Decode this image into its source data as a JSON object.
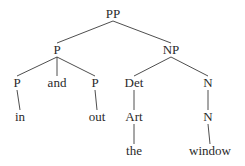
{
  "diagram": {
    "type": "syntax-tree",
    "nodes": [
      {
        "id": "pp",
        "label": "PP"
      },
      {
        "id": "p_top",
        "label": "P"
      },
      {
        "id": "np",
        "label": "NP"
      },
      {
        "id": "p_left",
        "label": "P"
      },
      {
        "id": "and",
        "label": "and"
      },
      {
        "id": "p_right",
        "label": "P"
      },
      {
        "id": "det",
        "label": "Det"
      },
      {
        "id": "n_top",
        "label": "N"
      },
      {
        "id": "in",
        "label": "in"
      },
      {
        "id": "out",
        "label": "out"
      },
      {
        "id": "art",
        "label": "Art"
      },
      {
        "id": "n_mid",
        "label": "N"
      },
      {
        "id": "the",
        "label": "the"
      },
      {
        "id": "window",
        "label": "window"
      }
    ],
    "edges": [
      [
        "pp",
        "p_top"
      ],
      [
        "pp",
        "np"
      ],
      [
        "p_top",
        "p_left"
      ],
      [
        "p_top",
        "and"
      ],
      [
        "p_top",
        "p_right"
      ],
      [
        "np",
        "det"
      ],
      [
        "np",
        "n_top"
      ],
      [
        "p_left",
        "in"
      ],
      [
        "p_right",
        "out"
      ],
      [
        "det",
        "art"
      ],
      [
        "art",
        "the"
      ],
      [
        "n_top",
        "n_mid"
      ],
      [
        "n_mid",
        "window"
      ]
    ]
  }
}
